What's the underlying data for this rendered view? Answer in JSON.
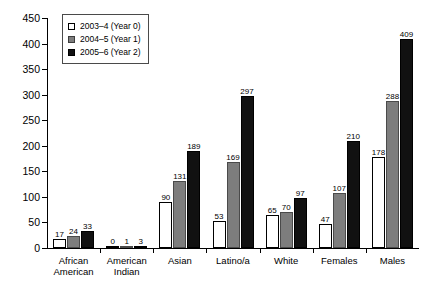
{
  "chart_data": {
    "type": "bar",
    "title": "",
    "xlabel": "",
    "ylabel": "",
    "ylim": [
      0,
      450
    ],
    "ytick_values": [
      0,
      50,
      100,
      150,
      200,
      250,
      300,
      350,
      400,
      450
    ],
    "ytick_labels": [
      "0",
      "50",
      "100",
      "150",
      "200",
      "250",
      "300",
      "350",
      "400",
      "450"
    ],
    "grid": false,
    "legend_position": "upper-left-inside",
    "categories": [
      "African\nAmerican",
      "American\nIndian",
      "Asian",
      "Latino/a",
      "White",
      "Females",
      "Males"
    ],
    "category_labels": [
      [
        "African",
        "American"
      ],
      [
        "American",
        "Indian"
      ],
      [
        "Asian",
        ""
      ],
      [
        "Latino/a",
        ""
      ],
      [
        "White",
        ""
      ],
      [
        "Females",
        ""
      ],
      [
        "Males",
        ""
      ]
    ],
    "series": [
      {
        "name": "2003–4 (Year 0)",
        "color": "#ffffff",
        "values": [
          17,
          0,
          90,
          53,
          65,
          47,
          178
        ],
        "labels": [
          "17",
          "0",
          "90",
          "53",
          "65",
          "47",
          "178"
        ]
      },
      {
        "name": "2004–5 (Year 1)",
        "color": "#7d7d7d",
        "values": [
          24,
          1,
          131,
          169,
          70,
          107,
          288
        ],
        "labels": [
          "24",
          "1",
          "131",
          "169",
          "70",
          "107",
          "288"
        ]
      },
      {
        "name": "2005–6 (Year 2)",
        "color": "#111111",
        "values": [
          33,
          3,
          189,
          297,
          97,
          210,
          409
        ],
        "labels": [
          "33",
          "3",
          "189",
          "297",
          "97",
          "210",
          "409"
        ]
      }
    ]
  },
  "legend": {
    "items": [
      {
        "label": "2003–4 (Year 0)",
        "swatch": "white-square-icon"
      },
      {
        "label": "2004–5 (Year 1)",
        "swatch": "gray-square-icon"
      },
      {
        "label": "2005–6 (Year 2)",
        "swatch": "black-square-icon"
      }
    ]
  }
}
